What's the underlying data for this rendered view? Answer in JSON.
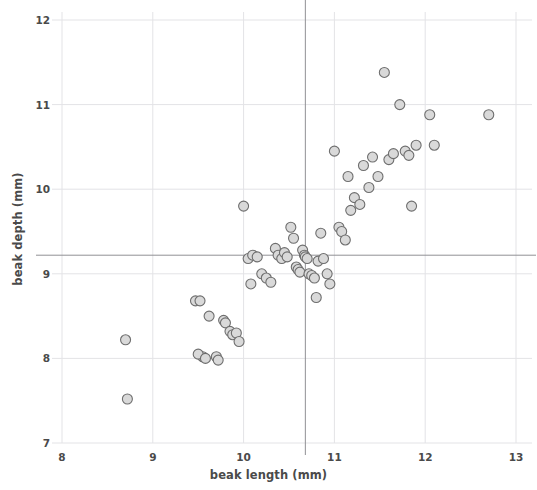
{
  "chart_data": {
    "type": "scatter",
    "title": "",
    "xlabel": "beak length (mm)",
    "ylabel": "beak depth (mm)",
    "xlim": [
      8,
      13
    ],
    "ylim": [
      7,
      12
    ],
    "xticks": [
      8,
      9,
      10,
      11,
      12,
      13
    ],
    "yticks": [
      7,
      8,
      9,
      10,
      11,
      12
    ],
    "xtick_labels": [
      "8",
      "9",
      "10",
      "11",
      "12",
      "13"
    ],
    "ytick_labels": [
      "7",
      "8",
      "9",
      "10",
      "11",
      "12"
    ],
    "grid": true,
    "grid_color": "#e3e3e6",
    "legend": null,
    "marker": {
      "shape": "circle",
      "fill_color": "#d9d9d9",
      "edge_color": "#6e6e6e",
      "size_px": 10
    },
    "reference_lines": [
      {
        "name": "mean-beak-depth",
        "orientation": "horizontal",
        "value": 9.22,
        "color": "#909094"
      },
      {
        "name": "mean-beak-length",
        "orientation": "vertical",
        "value": 10.68,
        "color": "#909094"
      }
    ],
    "x": [
      8.7,
      8.72,
      9.47,
      9.52,
      9.55,
      9.5,
      9.62,
      9.58,
      9.7,
      9.72,
      9.78,
      9.8,
      9.85,
      9.88,
      9.92,
      9.95,
      10.0,
      10.05,
      10.1,
      10.08,
      10.15,
      10.2,
      10.25,
      10.3,
      10.35,
      10.38,
      10.42,
      10.45,
      10.48,
      10.52,
      10.55,
      10.58,
      10.6,
      10.62,
      10.65,
      10.67,
      10.68,
      10.7,
      10.72,
      10.75,
      10.78,
      10.8,
      10.82,
      10.85,
      10.88,
      10.92,
      10.95,
      11.0,
      11.05,
      11.08,
      11.12,
      11.15,
      11.18,
      11.22,
      11.28,
      11.32,
      11.38,
      11.42,
      11.48,
      11.55,
      11.6,
      11.65,
      11.72,
      11.78,
      11.82,
      11.85,
      11.9,
      12.05,
      12.1,
      12.7
    ],
    "y": [
      8.22,
      7.52,
      8.68,
      8.68,
      8.02,
      8.05,
      8.5,
      8.0,
      8.02,
      7.98,
      8.45,
      8.42,
      8.32,
      8.28,
      8.3,
      8.2,
      9.8,
      9.18,
      9.22,
      8.88,
      9.2,
      9.0,
      8.95,
      8.9,
      9.3,
      9.22,
      9.18,
      9.25,
      9.2,
      9.55,
      9.42,
      9.08,
      9.05,
      9.02,
      9.28,
      9.22,
      9.2,
      9.18,
      9.0,
      8.98,
      8.95,
      8.72,
      9.15,
      9.48,
      9.18,
      9.0,
      8.88,
      10.45,
      9.55,
      9.5,
      9.4,
      10.15,
      9.75,
      9.9,
      9.82,
      10.28,
      10.02,
      10.38,
      10.15,
      11.38,
      10.35,
      10.42,
      11.0,
      10.45,
      10.4,
      9.8,
      10.52,
      10.88,
      10.52,
      10.88
    ],
    "n_points": 70
  },
  "axes": {
    "x_title": "beak length (mm)",
    "y_title": "beak depth (mm)"
  }
}
